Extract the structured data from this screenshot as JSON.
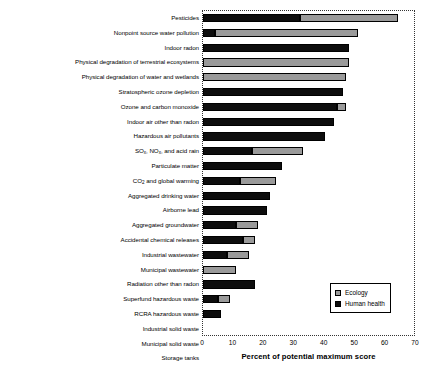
{
  "chart_data": {
    "type": "bar",
    "orientation": "horizontal",
    "stacked": true,
    "title": "",
    "xlabel": "Percent of potential maximum score",
    "ylabel": "",
    "xlim": [
      0,
      70
    ],
    "xticks": [
      0,
      10,
      20,
      30,
      40,
      50,
      60,
      70
    ],
    "grid": false,
    "legend_position": "bottom-right",
    "categories": [
      "Pesticides",
      "Nonpoint source water pollution",
      "Indoor radon",
      "Physical degradation of terrestrial ecosystems",
      "Physical degradation of water and wetlands",
      "Stratospheric ozone depletion",
      "Ozone and carbon monoxide",
      "Indoor air other than radon",
      "Hazardous air pollutants",
      "SO_x, NO_x, and acid rain",
      "Particulate matter",
      "CO_2 and global warming",
      "Aggregated drinking water",
      "Airborne lead",
      "Aggregated groundwater",
      "Accidental chemical releases",
      "Industrial wastewater",
      "Municipal wastewater",
      "Radiation other than radon",
      "Superfund hazardous waste",
      "RCRA hazardous waste",
      "Industrial solid waste",
      "Municipal solid waste",
      "Storage tanks"
    ],
    "series": [
      {
        "name": "Human health",
        "color": "#0d0d0d",
        "values": [
          32,
          4,
          48,
          0,
          0,
          46,
          44,
          43,
          40,
          16,
          26,
          12,
          22,
          21,
          11,
          13,
          8,
          0,
          17,
          5,
          6,
          0,
          0,
          0
        ]
      },
      {
        "name": "Ecology",
        "color": "#9a9a9a",
        "values": [
          32,
          47,
          0,
          48,
          47,
          0,
          3,
          0,
          0,
          17,
          0,
          12,
          0,
          0,
          7,
          4,
          7,
          11,
          0,
          4,
          0,
          0,
          0,
          0
        ]
      }
    ],
    "totals": [
      64,
      51,
      48,
      48,
      47,
      46,
      47,
      43,
      40,
      33,
      26,
      24,
      22,
      21,
      18,
      17,
      15,
      11,
      17,
      9,
      6,
      0,
      0,
      0
    ]
  },
  "rows": [
    {
      "label": "Pesticides",
      "label_html": "Pesticides",
      "health": 32,
      "eco": 32
    },
    {
      "label": "Nonpoint source water pollution",
      "label_html": "Nonpoint source water pollution",
      "health": 4,
      "eco": 47
    },
    {
      "label": "Indoor radon",
      "label_html": "Indoor radon",
      "health": 48,
      "eco": 0
    },
    {
      "label": "Physical degradation of terrestrial ecosystems",
      "label_html": "Physical degradation of terrestrial ecosystems",
      "health": 0,
      "eco": 48
    },
    {
      "label": "Physical degradation of water and wetlands",
      "label_html": "Physical degradation of water and wetlands",
      "health": 0,
      "eco": 47
    },
    {
      "label": "Stratospheric ozone depletion",
      "label_html": "Stratospheric ozone depletion",
      "health": 46,
      "eco": 0
    },
    {
      "label": "Ozone and carbon monoxide",
      "label_html": "Ozone and carbon monoxide",
      "health": 44,
      "eco": 3
    },
    {
      "label": "Indoor air other than radon",
      "label_html": "Indoor air other than radon",
      "health": 43,
      "eco": 0
    },
    {
      "label": "Hazardous air pollutants",
      "label_html": "Hazardous air pollutants",
      "health": 40,
      "eco": 0
    },
    {
      "label": "SOx, NOx, and acid rain",
      "label_html": "SO<sub>x</sub>, NO<sub>x</sub>, and acid rain",
      "health": 16,
      "eco": 17
    },
    {
      "label": "Particulate matter",
      "label_html": "Particulate matter",
      "health": 26,
      "eco": 0
    },
    {
      "label": "CO2 and global warming",
      "label_html": "CO<sub>2</sub> and global warming",
      "health": 12,
      "eco": 12
    },
    {
      "label": "Aggregated drinking water",
      "label_html": "Aggregated drinking water",
      "health": 22,
      "eco": 0
    },
    {
      "label": "Airborne lead",
      "label_html": "Airborne lead",
      "health": 21,
      "eco": 0
    },
    {
      "label": "Aggregated groundwater",
      "label_html": "Aggregated groundwater",
      "health": 11,
      "eco": 7
    },
    {
      "label": "Accidental chemical releases",
      "label_html": "Accidental chemical releases",
      "health": 13,
      "eco": 4
    },
    {
      "label": "Industrial wastewater",
      "label_html": "Industrial wastewater",
      "health": 8,
      "eco": 7
    },
    {
      "label": "Municipal wastewater",
      "label_html": "Municipal wastewater",
      "health": 0,
      "eco": 11
    },
    {
      "label": "Radiation other than radon",
      "label_html": "Radiation other than radon",
      "health": 17,
      "eco": 0
    },
    {
      "label": "Superfund hazardous waste",
      "label_html": "Superfund hazardous waste",
      "health": 5,
      "eco": 4
    },
    {
      "label": "RCRA hazardous waste",
      "label_html": "RCRA hazardous waste",
      "health": 6,
      "eco": 0
    },
    {
      "label": "Industrial solid waste",
      "label_html": "Industrial solid waste",
      "health": 0,
      "eco": 0
    },
    {
      "label": "Municipal solid waste",
      "label_html": "Municipal solid waste",
      "health": 0,
      "eco": 0
    },
    {
      "label": "Storage tanks",
      "label_html": "Storage tanks",
      "health": 0,
      "eco": 0
    }
  ],
  "axis": {
    "x_title": "Percent of potential maximum score",
    "x_ticks": [
      "0",
      "10",
      "20",
      "30",
      "40",
      "50",
      "60",
      "70"
    ],
    "x_min": 0,
    "x_max": 70
  },
  "legend": {
    "items": [
      {
        "label": "Ecology",
        "color": "#9a9a9a"
      },
      {
        "label": "Human health",
        "color": "#0d0d0d"
      }
    ]
  }
}
